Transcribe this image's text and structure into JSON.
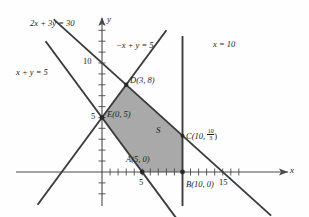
{
  "figure": {
    "region_label": "S",
    "axes": {
      "x_label": "x",
      "y_label": "y",
      "x_ticks": [
        {
          "value": 5,
          "label": "5"
        },
        {
          "value": 15,
          "label": "15"
        }
      ],
      "y_ticks": [
        {
          "value": 5,
          "label": "5"
        },
        {
          "value": 10,
          "label": "10"
        }
      ],
      "x_range": [
        -5,
        17
      ],
      "y_range": [
        -5,
        12
      ]
    },
    "lines": [
      {
        "name": "line-2x-3y-30",
        "label": "2x + 3y = 30",
        "label_plain": "2x + 3y = 30",
        "equation": "2x+3y=30"
      },
      {
        "name": "line-x-y-5",
        "label": "x + y = 5",
        "label_plain": "x + y = 5",
        "equation": "x+y=5"
      },
      {
        "name": "line-neg-x-y-5",
        "label": "−x + y = 5",
        "label_plain": "-x + y = 5",
        "equation": "-x+y=5"
      },
      {
        "name": "line-x-10",
        "label": "x = 10",
        "label_plain": "x = 10",
        "equation": "x=10"
      }
    ],
    "vertices": [
      {
        "name": "point-A",
        "label": "A(5, 0)",
        "letter": "A",
        "x": 5,
        "y": 0
      },
      {
        "name": "point-B",
        "label": "B(10, 0)",
        "letter": "B",
        "x": 10,
        "y": 0
      },
      {
        "name": "point-C",
        "label": "C(10, ",
        "letter": "C",
        "x": 10,
        "y": 3.3333,
        "frac_num": "10",
        "frac_den": "3",
        "close": ")"
      },
      {
        "name": "point-D",
        "label": "D(3, 8)",
        "letter": "D",
        "x": 3,
        "y": 8
      },
      {
        "name": "point-E",
        "label": "E(0, 5)",
        "letter": "E",
        "x": 0,
        "y": 5
      }
    ],
    "colors": {
      "shade": "#a9a9a9",
      "line": "#3c3c3c",
      "axis": "#4a4a4a",
      "text": "#1a1a1a"
    }
  }
}
